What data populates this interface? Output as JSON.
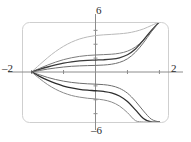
{
  "figure": {
    "name": "solution-curve-family-plot",
    "frame_color": "#cfcfcf",
    "axis_color": "#8c8c8c",
    "background": "#ffffff"
  },
  "labels": {
    "x_min": "–2",
    "x_max": "2",
    "y_max": "6",
    "y_min": "–6"
  },
  "chart_data": {
    "type": "line",
    "title": "",
    "xlabel": "",
    "ylabel": "",
    "xlim": [
      -2.3,
      2.3
    ],
    "ylim": [
      -7.2,
      7.2
    ],
    "grid": false,
    "legend": "none",
    "xticks": [
      -2,
      -1,
      0,
      1,
      2
    ],
    "xtick_labels": [
      "–2",
      "",
      "",
      "",
      "2"
    ],
    "yticks": [
      -6,
      -4,
      -2,
      0,
      2,
      4,
      6
    ],
    "ytick_labels": [
      "–6",
      "",
      "",
      "",
      "",
      "",
      "6"
    ],
    "common_point": [
      -2,
      0
    ],
    "series": [
      {
        "name": "curve-upper-4",
        "color": "#b9b9b9",
        "width": 1.0,
        "x": [
          -2.0,
          -1.75,
          -1.5,
          -1.25,
          -1.0,
          -0.75,
          -0.5,
          -0.25,
          0.0,
          0.25,
          0.5,
          0.75,
          1.0,
          1.25,
          1.5,
          1.75,
          2.0
        ],
        "y": [
          0.0,
          1.05,
          2.05,
          2.95,
          3.7,
          4.3,
          4.75,
          5.05,
          5.25,
          5.35,
          5.42,
          5.5,
          5.62,
          5.85,
          6.2,
          6.7,
          7.2
        ]
      },
      {
        "name": "curve-upper-3",
        "color": "#7c7c7c",
        "width": 1.0,
        "x": [
          -2.0,
          -1.75,
          -1.5,
          -1.25,
          -1.0,
          -0.75,
          -0.5,
          -0.25,
          0.0,
          0.25,
          0.5,
          0.75,
          1.0,
          1.25,
          1.5,
          1.75,
          2.0
        ],
        "y": [
          0.0,
          0.52,
          1.0,
          1.42,
          1.78,
          2.05,
          2.25,
          2.38,
          2.45,
          2.5,
          2.56,
          2.7,
          3.0,
          3.6,
          4.6,
          5.9,
          7.2
        ]
      },
      {
        "name": "curve-upper-2",
        "color": "#3a3a3a",
        "width": 1.3,
        "x": [
          -2.0,
          -1.75,
          -1.5,
          -1.25,
          -1.0,
          -0.75,
          -0.5,
          -0.25,
          0.0,
          0.25,
          0.5,
          0.75,
          1.0,
          1.25,
          1.5,
          1.75,
          2.0
        ],
        "y": [
          0.0,
          0.38,
          0.72,
          1.02,
          1.28,
          1.47,
          1.6,
          1.68,
          1.72,
          1.76,
          1.85,
          2.05,
          2.48,
          3.3,
          4.6,
          6.0,
          7.2
        ]
      },
      {
        "name": "curve-upper-1",
        "color": "#6e6e6e",
        "width": 1.0,
        "x": [
          -2.0,
          -1.75,
          -1.5,
          -1.25,
          -1.0,
          -0.75,
          -0.5,
          -0.25,
          0.0,
          0.25,
          0.5,
          0.75,
          1.0,
          1.25,
          1.5,
          1.75,
          2.0
        ],
        "y": [
          0.0,
          0.22,
          0.42,
          0.58,
          0.72,
          0.82,
          0.88,
          0.92,
          0.95,
          1.0,
          1.12,
          1.38,
          1.9,
          2.85,
          4.2,
          5.8,
          7.2
        ]
      },
      {
        "name": "curve-lower-1",
        "color": "#6e6e6e",
        "width": 1.0,
        "x": [
          -2.0,
          -1.75,
          -1.5,
          -1.25,
          -1.0,
          -0.75,
          -0.5,
          -0.25,
          0.0,
          0.25,
          0.5,
          0.75,
          1.0,
          1.25,
          1.5,
          1.75,
          2.0
        ],
        "y": [
          0.0,
          -0.4,
          -0.78,
          -1.08,
          -1.32,
          -1.5,
          -1.62,
          -1.7,
          -1.75,
          -1.82,
          -1.98,
          -2.35,
          -3.05,
          -4.2,
          -5.6,
          -6.8,
          -7.2
        ]
      },
      {
        "name": "curve-lower-2",
        "color": "#2e2e2e",
        "width": 1.3,
        "x": [
          -2.0,
          -1.75,
          -1.5,
          -1.25,
          -1.0,
          -0.75,
          -0.5,
          -0.25,
          0.0,
          0.25,
          0.5,
          0.75,
          1.0,
          1.25,
          1.5,
          1.75,
          2.0
        ],
        "y": [
          0.0,
          -0.62,
          -1.18,
          -1.65,
          -2.02,
          -2.3,
          -2.5,
          -2.62,
          -2.7,
          -2.8,
          -3.0,
          -3.45,
          -4.25,
          -5.45,
          -6.7,
          -7.2,
          -7.2
        ]
      },
      {
        "name": "curve-lower-3",
        "color": "#8a8a8a",
        "width": 1.0,
        "x": [
          -2.0,
          -1.75,
          -1.5,
          -1.25,
          -1.0,
          -0.75,
          -0.5,
          -0.25,
          0.0,
          0.25,
          0.5,
          0.75,
          1.0,
          1.25,
          1.5,
          1.75,
          2.0
        ],
        "y": [
          0.0,
          -0.95,
          -1.8,
          -2.48,
          -3.0,
          -3.38,
          -3.62,
          -3.78,
          -3.88,
          -4.02,
          -4.32,
          -4.9,
          -5.85,
          -7.0,
          -7.2,
          -7.2,
          -7.2
        ]
      }
    ]
  }
}
